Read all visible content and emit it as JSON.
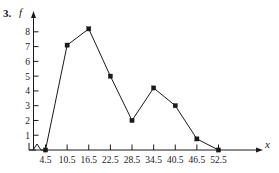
{
  "problem": {
    "number": "3."
  },
  "chart_data": {
    "type": "line",
    "title": "",
    "subtitle": "",
    "xlabel": "x",
    "ylabel": "f",
    "x": [
      4.5,
      10.5,
      16.5,
      22.5,
      28.5,
      34.5,
      40.5,
      46.5,
      52.5
    ],
    "values": [
      0,
      7.1,
      8.2,
      5,
      2,
      4.2,
      3,
      0.75,
      0
    ],
    "xtick_labels": [
      "4.5",
      "10.5",
      "16.5",
      "22.5",
      "28.5",
      "34.5",
      "40.5",
      "46.5",
      "52.5"
    ],
    "ytick_labels": [
      "1",
      "2",
      "3",
      "4",
      "5",
      "6",
      "7",
      "8"
    ],
    "ytick_values": [
      1,
      2,
      3,
      4,
      5,
      6,
      7,
      8
    ],
    "xlim": [
      4.5,
      52.5
    ],
    "ylim": [
      0,
      8.8
    ],
    "grid": false,
    "legend": "none",
    "markers": "filled-square",
    "axis_break_x": true,
    "line_color": "#1a1a1a",
    "marker_color": "#1a1a1a",
    "background_color": "#ffffff"
  }
}
